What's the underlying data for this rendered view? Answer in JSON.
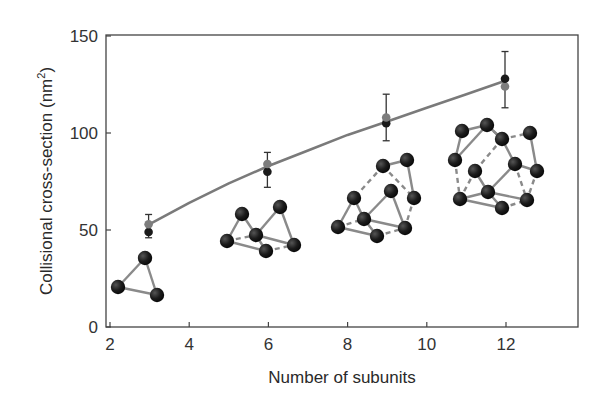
{
  "chart_data": {
    "type": "scatter",
    "title": "",
    "xlabel": "Number of subunits",
    "ylabel": "Collisional cross-section (nm²)",
    "ylabel_parts": {
      "main": "Collisional cross-section (nm",
      "sup": "2",
      "close": ")"
    },
    "xlim": [
      2,
      13.8
    ],
    "ylim": [
      0,
      150
    ],
    "xticks": [
      2,
      4,
      6,
      8,
      10,
      12
    ],
    "yticks": [
      0,
      50,
      100,
      150
    ],
    "grid": false,
    "legend": null,
    "series": [
      {
        "name": "measured",
        "color": "#1a1a1a",
        "marker": "circle",
        "x": [
          3,
          6,
          9,
          12
        ],
        "y": [
          49,
          80,
          105,
          128
        ],
        "error_low": [
          46,
          72,
          96,
          113
        ],
        "error_high": [
          58,
          90,
          120,
          142
        ]
      },
      {
        "name": "calculated",
        "color": "#7d7d7d",
        "marker": "circle",
        "x": [
          3,
          6,
          9,
          12
        ],
        "y": [
          53,
          84,
          108,
          124
        ]
      },
      {
        "name": "fit curve",
        "type": "line",
        "color": "#7a7a7a",
        "x": [
          3,
          4,
          5,
          6,
          7,
          8,
          9,
          10,
          11,
          12
        ],
        "y": [
          53,
          64,
          74,
          83,
          91,
          99,
          106,
          113,
          120,
          127
        ]
      }
    ],
    "annotations": [
      {
        "label": "trimer structure",
        "subunits": 3,
        "atoms": [
          [
            118,
            287
          ],
          [
            145,
            258
          ],
          [
            157,
            295
          ]
        ],
        "bonds": [
          [
            0,
            1,
            "solid"
          ],
          [
            1,
            2,
            "solid"
          ],
          [
            0,
            2,
            "solid"
          ]
        ]
      },
      {
        "label": "hexamer structure",
        "subunits": 6,
        "atoms": [
          [
            242,
            214
          ],
          [
            227,
            241
          ],
          [
            256,
            235
          ],
          [
            266,
            251
          ],
          [
            280,
            207
          ],
          [
            294,
            245
          ]
        ],
        "bonds": [
          [
            0,
            1,
            "solid"
          ],
          [
            0,
            2,
            "solid"
          ],
          [
            1,
            3,
            "solid"
          ],
          [
            2,
            3,
            "solid"
          ],
          [
            2,
            4,
            "solid"
          ],
          [
            4,
            5,
            "solid"
          ],
          [
            2,
            5,
            "solid"
          ],
          [
            3,
            5,
            "dashed"
          ],
          [
            1,
            2,
            "dashed"
          ]
        ]
      },
      {
        "label": "nonamer structure",
        "subunits": 9,
        "atoms": [
          [
            383,
            166
          ],
          [
            407,
            160
          ],
          [
            354,
            198
          ],
          [
            391,
            191
          ],
          [
            414,
            198
          ],
          [
            338,
            227
          ],
          [
            364,
            219
          ],
          [
            377,
            236
          ],
          [
            405,
            228
          ]
        ],
        "bonds": [
          [
            0,
            1,
            "solid"
          ],
          [
            1,
            4,
            "solid"
          ],
          [
            0,
            4,
            "dashed"
          ],
          [
            0,
            2,
            "dashed"
          ],
          [
            2,
            5,
            "solid"
          ],
          [
            2,
            6,
            "solid"
          ],
          [
            5,
            6,
            "dashed"
          ],
          [
            5,
            7,
            "solid"
          ],
          [
            6,
            7,
            "solid"
          ],
          [
            3,
            6,
            "solid"
          ],
          [
            3,
            8,
            "solid"
          ],
          [
            6,
            8,
            "solid"
          ],
          [
            7,
            8,
            "dashed"
          ],
          [
            4,
            8,
            "dashed"
          ]
        ]
      },
      {
        "label": "dodecamer structure",
        "subunits": 12,
        "atoms": [
          [
            462,
            131
          ],
          [
            487,
            125
          ],
          [
            502,
            139
          ],
          [
            530,
            133
          ],
          [
            455,
            160
          ],
          [
            475,
            171
          ],
          [
            515,
            164
          ],
          [
            537,
            171
          ],
          [
            460,
            199
          ],
          [
            488,
            192
          ],
          [
            502,
            208
          ],
          [
            527,
            200
          ]
        ],
        "bonds": [
          [
            0,
            1,
            "solid"
          ],
          [
            0,
            4,
            "solid"
          ],
          [
            1,
            4,
            "solid"
          ],
          [
            1,
            2,
            "dashed"
          ],
          [
            2,
            3,
            "dashed"
          ],
          [
            3,
            7,
            "solid"
          ],
          [
            2,
            6,
            "solid"
          ],
          [
            6,
            7,
            "solid"
          ],
          [
            1,
            2,
            "solid"
          ],
          [
            4,
            8,
            "dashed"
          ],
          [
            5,
            8,
            "dashed"
          ],
          [
            5,
            9,
            "solid"
          ],
          [
            8,
            9,
            "solid"
          ],
          [
            8,
            10,
            "solid"
          ],
          [
            9,
            10,
            "solid"
          ],
          [
            6,
            9,
            "solid"
          ],
          [
            9,
            11,
            "solid"
          ],
          [
            10,
            11,
            "dashed"
          ],
          [
            7,
            11,
            "dashed"
          ],
          [
            2,
            5,
            "dashed"
          ],
          [
            6,
            11,
            "dashed"
          ]
        ]
      }
    ]
  },
  "colors": {
    "axis": "#444444",
    "curve": "#7a7a7a",
    "marker_dark": "#1a1a1a",
    "marker_gray": "#7d7d7d",
    "bond": "#8a8a8a",
    "atom": "#1c1c1c"
  }
}
